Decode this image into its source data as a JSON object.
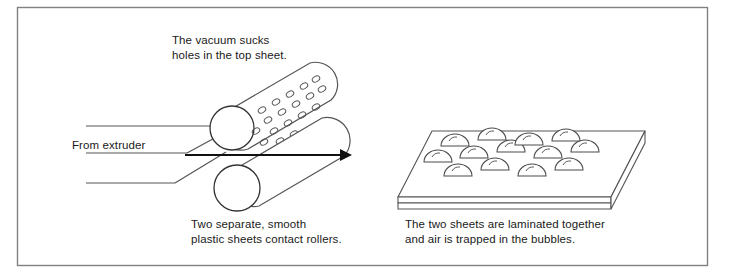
{
  "figure": {
    "border_color": "#808080",
    "line_color": "#1a1a1a",
    "sheet_line_color": "#555555",
    "bubble_line_color": "#4a4a4a",
    "text_color": "#1a1a1a",
    "background": "#ffffff"
  },
  "captions": {
    "vacuum": "The vacuum sucks\nholes in the top sheet.",
    "extruder": "From extruder",
    "rollers": "Two separate, smooth\nplastic sheets contact rollers.",
    "laminated": "The two sheets are laminated together\nand air is trapped in the bubbles."
  },
  "elements": {
    "perforated_roller_label": "perforated vacuum roller",
    "smooth_roller_label": "smooth roller",
    "flow_arrow_label": "direction of travel",
    "bubble_sheet_label": "laminated bubble sheet",
    "feed_sheets_label": "incoming plastic sheets"
  }
}
